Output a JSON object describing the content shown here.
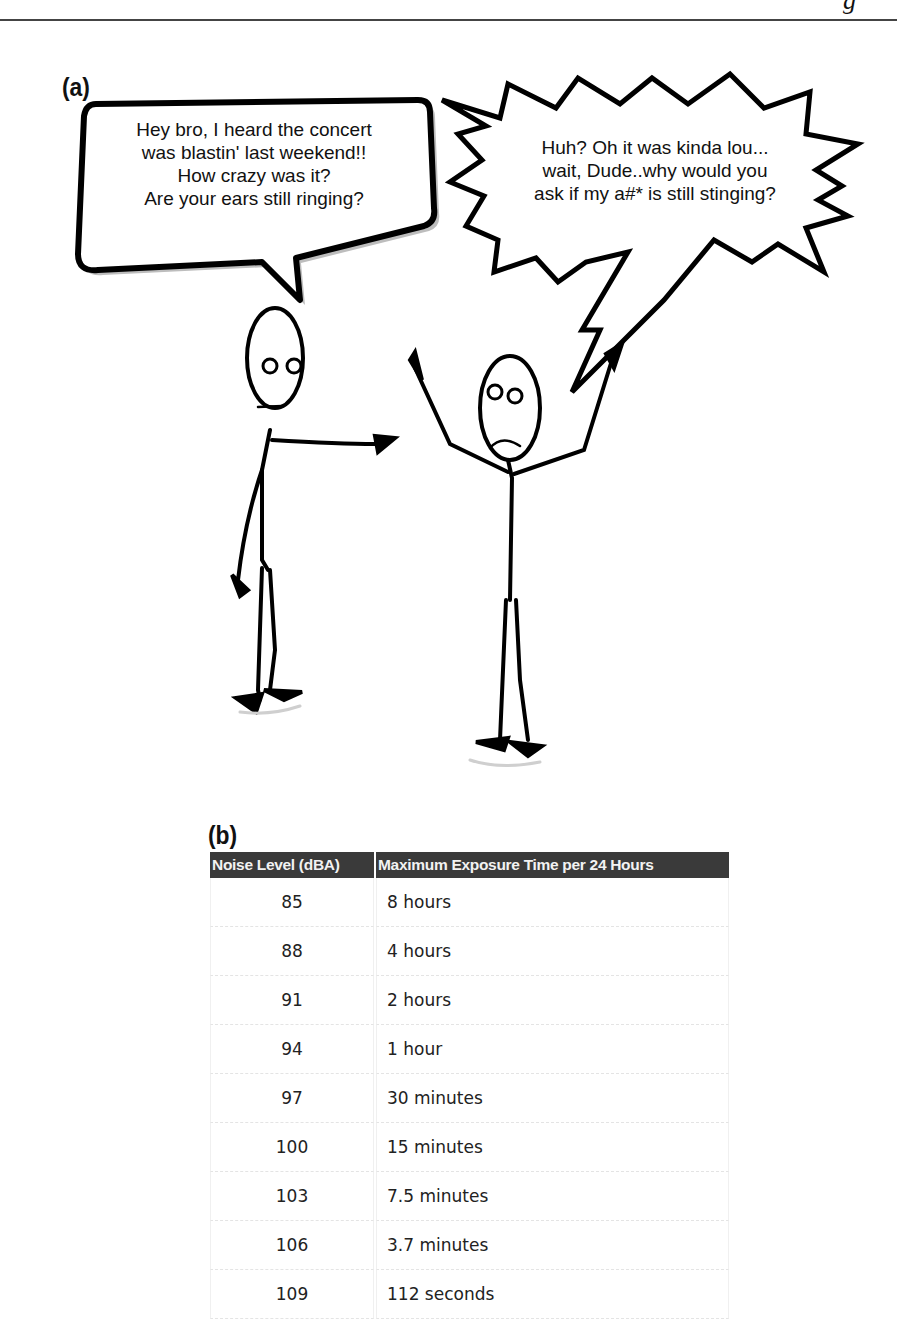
{
  "page": {
    "header_glyph": "g"
  },
  "panel_a": {
    "label": "(a)",
    "speech_bubble_left": {
      "speaker": "left stick figure",
      "lines": [
        "Hey bro, I heard the concert",
        "was blastin' last weekend!!",
        "How crazy was it?",
        "Are your ears still ringing?"
      ]
    },
    "speech_bubble_right": {
      "speaker": "right stick figure",
      "lines": [
        "Huh? Oh it was kinda lou...",
        "wait, Dude..why would you",
        "ask if my a#* is still stinging?"
      ]
    },
    "figures": [
      {
        "name": "left-figure",
        "expression": "neutral",
        "pose": "pointing"
      },
      {
        "name": "right-figure",
        "expression": "frown",
        "pose": "arms-raised"
      }
    ]
  },
  "panel_b": {
    "label": "(b)",
    "table": {
      "headers": [
        "Noise Level (dBA)",
        "Maximum Exposure Time per 24 Hours"
      ],
      "rows": [
        [
          "85",
          "8 hours"
        ],
        [
          "88",
          "4 hours"
        ],
        [
          "91",
          "2 hours"
        ],
        [
          "94",
          "1 hour"
        ],
        [
          "97",
          "30 minutes"
        ],
        [
          "100",
          "15 minutes"
        ],
        [
          "103",
          "7.5 minutes"
        ],
        [
          "106",
          "3.7 minutes"
        ],
        [
          "109",
          "112 seconds"
        ]
      ]
    },
    "colors": {
      "header_bg": "#3a3a3a",
      "header_text": "#f2f2f2"
    }
  }
}
